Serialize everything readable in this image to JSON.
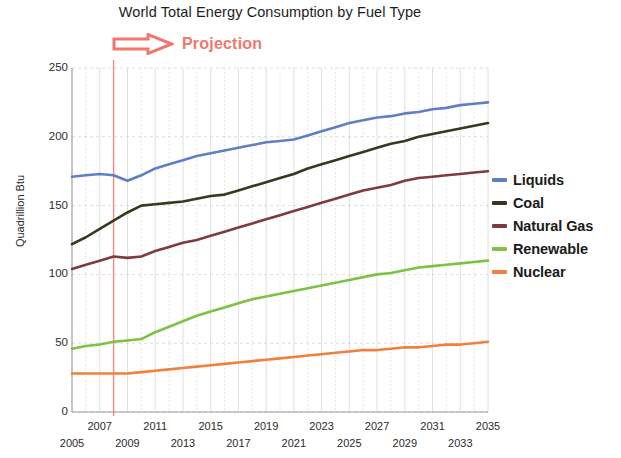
{
  "chart_data": {
    "type": "line",
    "title": "World Total Energy Consumption by Fuel Type",
    "xlabel": "",
    "ylabel": "Quadrillion Btu",
    "ylim": [
      0,
      250
    ],
    "xlim": [
      2005,
      2035
    ],
    "ytick_values": [
      0,
      50,
      100,
      150,
      200,
      250
    ],
    "ytick_labels": [
      "0",
      "50",
      "100",
      "150",
      "200",
      "250"
    ],
    "grid": true,
    "legend_position": "right",
    "annotations": [
      {
        "name": "projection-marker",
        "label": "Projection",
        "icon": "right-arrow-icon",
        "color": "#f2776b",
        "vline_year": 2008
      }
    ],
    "x": [
      2005,
      2006,
      2007,
      2008,
      2009,
      2010,
      2011,
      2012,
      2013,
      2014,
      2015,
      2016,
      2017,
      2018,
      2019,
      2020,
      2021,
      2022,
      2023,
      2024,
      2025,
      2026,
      2027,
      2028,
      2029,
      2030,
      2031,
      2032,
      2033,
      2034,
      2035
    ],
    "series": [
      {
        "name": "Liquids",
        "color": "#5f7fc4",
        "values": [
          171,
          172,
          173,
          172,
          168,
          172,
          177,
          180,
          183,
          186,
          188,
          190,
          192,
          194,
          196,
          197,
          198,
          201,
          204,
          207,
          210,
          212,
          214,
          215,
          217,
          218,
          220,
          221,
          223,
          224,
          225
        ]
      },
      {
        "name": "Coal",
        "color": "#343a1e",
        "values": [
          122,
          127,
          133,
          139,
          145,
          150,
          151,
          152,
          153,
          155,
          157,
          158,
          161,
          164,
          167,
          170,
          173,
          177,
          180,
          183,
          186,
          189,
          192,
          195,
          197,
          200,
          202,
          204,
          206,
          208,
          210
        ]
      },
      {
        "name": "Natural Gas",
        "color": "#7e3b3b",
        "values": [
          104,
          107,
          110,
          113,
          112,
          113,
          117,
          120,
          123,
          125,
          128,
          131,
          134,
          137,
          140,
          143,
          146,
          149,
          152,
          155,
          158,
          161,
          163,
          165,
          168,
          170,
          171,
          172,
          173,
          174,
          175
        ]
      },
      {
        "name": "Renewable",
        "color": "#7dc242",
        "values": [
          46,
          48,
          49,
          51,
          52,
          53,
          58,
          62,
          66,
          70,
          73,
          76,
          79,
          82,
          84,
          86,
          88,
          90,
          92,
          94,
          96,
          98,
          100,
          101,
          103,
          105,
          106,
          107,
          108,
          109,
          110
        ]
      },
      {
        "name": "Nuclear",
        "color": "#f0803c",
        "values": [
          28,
          28,
          28,
          28,
          28,
          29,
          30,
          31,
          32,
          33,
          34,
          35,
          36,
          37,
          38,
          39,
          40,
          41,
          42,
          43,
          44,
          45,
          45,
          46,
          47,
          47,
          48,
          49,
          49,
          50,
          51
        ]
      }
    ],
    "xtick_labels_top": [
      "2007",
      "2011",
      "2015",
      "2019",
      "2023",
      "2027",
      "2031",
      "2035"
    ],
    "xtick_labels_bottom": [
      "2005",
      "2009",
      "2013",
      "2017",
      "2021",
      "2025",
      "2029",
      "2033"
    ]
  },
  "colors": {
    "liquids": "#5f7fc4",
    "coal": "#343a1e",
    "natural_gas": "#7e3b3b",
    "renewable": "#7dc242",
    "nuclear": "#f0803c",
    "projection": "#f2776b",
    "grid": "#c9c9c9",
    "axis": "#9a9a9a"
  }
}
